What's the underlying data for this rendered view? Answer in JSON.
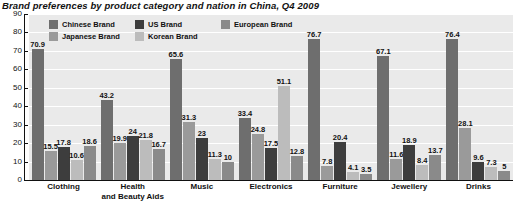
{
  "chart_data": {
    "type": "bar",
    "title": "Brand preferences by product category and nation in China, Q4 2009",
    "xlabel": "",
    "ylabel": "",
    "ylim": [
      0,
      90
    ],
    "ytick_values": [
      90,
      80,
      70,
      60,
      50,
      40,
      30,
      20,
      10,
      0
    ],
    "ytick_labels": [
      "90",
      "80",
      "70",
      "60",
      "50",
      "40",
      "30",
      "20",
      "10",
      "0"
    ],
    "grid": true,
    "legend_position": "top-left-inside",
    "categories": [
      "Clothing",
      "Health\nand Beauty Aids",
      "Music",
      "Electronics",
      "Furniture",
      "Jewellery",
      "Drinks"
    ],
    "series": [
      {
        "name": "Chinese Brand",
        "color": "#6e6e6e",
        "values": [
          70.9,
          43.2,
          65.6,
          33.4,
          76.7,
          67.1,
          76.4
        ],
        "labels": [
          "70.9",
          "43.2",
          "65.6",
          "33.4",
          "76.7",
          "67.1",
          "76.4"
        ]
      },
      {
        "name": "Japanese Brand",
        "color": "#9a9a9a",
        "values": [
          15.5,
          19.9,
          31.3,
          24.8,
          7.8,
          11.6,
          28.1
        ],
        "labels": [
          "15.5",
          "19.9",
          "31.3",
          "24.8",
          "7.8",
          "11.6",
          "28.1"
        ]
      },
      {
        "name": "US Brand",
        "color": "#3d3d3d",
        "values": [
          17.8,
          24,
          23,
          17.5,
          20.4,
          18.9,
          9.6
        ],
        "labels": [
          "17.8",
          "24",
          "23",
          "17.5",
          "20.4",
          "18.9",
          "9.6"
        ]
      },
      {
        "name": "Korean Brand",
        "color": "#bcbcbc",
        "values": [
          10.6,
          21.8,
          11.3,
          51.1,
          4.1,
          8.4,
          7.3
        ],
        "labels": [
          "10.6",
          "21.8",
          "11.3",
          "51.1",
          "4.1",
          "8.4",
          "7.3"
        ]
      },
      {
        "name": "European Brand",
        "color": "#8a8a8a",
        "values": [
          18.6,
          16.7,
          10,
          12.8,
          3.5,
          13.7,
          5
        ],
        "labels": [
          "18.6",
          "16.7",
          "10",
          "12.8",
          "3.5",
          "13.7",
          "5"
        ]
      }
    ],
    "legend_order": [
      "Chinese Brand",
      "US Brand",
      "European Brand",
      "Japanese Brand",
      "Korean Brand"
    ],
    "colors": {
      "plot_background": "#eaeaea",
      "gridline": "#ffffff",
      "axis": "#111111",
      "text": "#111111",
      "page_background": "#ffffff"
    }
  }
}
